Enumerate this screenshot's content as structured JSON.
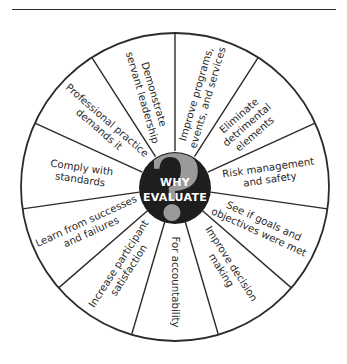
{
  "diagram": {
    "type": "wheel",
    "center_label": [
      "WHY",
      "EVALUATE"
    ],
    "center_icon": "question-mark-icon",
    "segments": [
      {
        "id": "improve-programs",
        "lines": [
          "Improve programs,",
          "events, and services"
        ]
      },
      {
        "id": "eliminate-detrimental",
        "lines": [
          "Eliminate",
          "detrimental",
          "elements"
        ]
      },
      {
        "id": "risk-management",
        "lines": [
          "Risk management",
          "and safety"
        ]
      },
      {
        "id": "goals-objectives",
        "lines": [
          "See if goals and",
          "objectives were met"
        ]
      },
      {
        "id": "improve-decision",
        "lines": [
          "Improve decision",
          "making"
        ]
      },
      {
        "id": "accountability",
        "lines": [
          "For accountability"
        ]
      },
      {
        "id": "participant-satisfaction",
        "lines": [
          "Increase participant",
          "satisfaction"
        ]
      },
      {
        "id": "learn-successes",
        "lines": [
          "Learn from successes",
          "and failures"
        ]
      },
      {
        "id": "comply-standards",
        "lines": [
          "Comply with",
          "standards"
        ]
      },
      {
        "id": "professional-practice",
        "lines": [
          "Professional practice",
          "demands it"
        ]
      },
      {
        "id": "servant-leadership",
        "lines": [
          "Demonstrate",
          "servant leadership"
        ]
      }
    ],
    "colors": {
      "line": "#2b2b2b",
      "hub": "#1e1e1e",
      "question_mark": "#9a9a9a",
      "text": "#2a2a2a",
      "background": "#ffffff"
    }
  }
}
